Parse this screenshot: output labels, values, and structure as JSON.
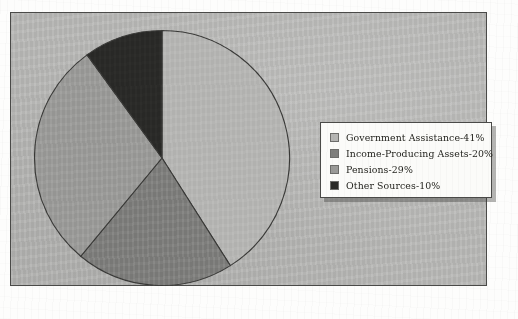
{
  "colors": {
    "canvas_background": "#b9b9b7",
    "canvas_border": "#4a4a48",
    "legend_background": "#fbfbf9",
    "legend_border": "#4a4a48",
    "slice_outline": "#3a3a38"
  },
  "legend": {
    "items": [
      {
        "label": "Government Assistance-41%",
        "color": "#b5b5b3"
      },
      {
        "label": "Income-Producing Assets-20%",
        "color": "#7e7e7c"
      },
      {
        "label": "Pensions-29%",
        "color": "#9a9a98"
      },
      {
        "label": "Other Sources-10%",
        "color": "#2a2a28"
      }
    ]
  },
  "chart_data": {
    "type": "pie",
    "title": "",
    "categories": [
      "Government Assistance",
      "Income-Producing Assets",
      "Pensions",
      "Other Sources"
    ],
    "values": [
      41,
      20,
      29,
      10
    ],
    "unit": "%",
    "labels": [
      "Government Assistance-41%",
      "Income-Producing Assets-20%",
      "Pensions-29%",
      "Other Sources-10%"
    ],
    "colors": [
      "#b5b5b3",
      "#7e7e7c",
      "#9a9a98",
      "#2a2a28"
    ],
    "start_angle_deg": 0,
    "direction": "clockwise",
    "legend_position": "right",
    "grid": false
  }
}
